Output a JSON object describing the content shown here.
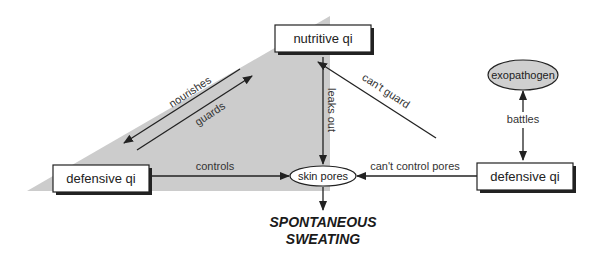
{
  "diagram": {
    "colors": {
      "background": "#ffffff",
      "shaded_region": "#cccccc",
      "line": "#222222",
      "box_fill": "#ffffff",
      "exopathogen_fill": "#cfcfcf",
      "text": "#222222"
    },
    "nodes": {
      "nutritive_qi": "nutritive qi",
      "defensive_qi_left": "defensive qi",
      "defensive_qi_right": "defensive qi",
      "skin_pores": "skin pores",
      "exopathogen": "exopathogen",
      "result_line1": "SPONTANEOUS",
      "result_line2": "SWEATING"
    },
    "edges": {
      "nourishes": "nourishes",
      "guards": "guards",
      "leaks_out": "leaks out",
      "controls": "controls",
      "cant_guard": "can't guard",
      "cant_control_pores": "can't control pores",
      "battles": "battles"
    }
  }
}
